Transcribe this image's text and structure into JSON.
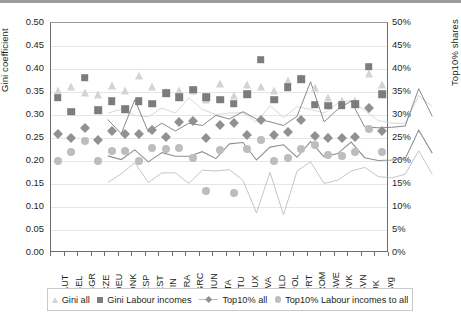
{
  "chart_data": {
    "type": "line",
    "title": "",
    "xlabel": "",
    "ylabel": "Gini coefficient",
    "ylabel_right": "Top10% shares",
    "ylim": [
      0.0,
      0.5
    ],
    "ylim_right": [
      0,
      50
    ],
    "grid": true,
    "legend_position": "bottom",
    "categories": [
      "AUT",
      "BEL",
      "BGR",
      "CZE",
      "DEU",
      "DNK",
      "ESP",
      "EST",
      "FIN",
      "FRA",
      "GRC",
      "HUN",
      "ITA",
      "LTU",
      "LUX",
      "LVA",
      "NLD",
      "POL",
      "PRT",
      "ROM",
      "SWE",
      "SVK",
      "SVN",
      "UK",
      "Avg"
    ],
    "yticks_left": [
      "0.00",
      "0.05",
      "0.10",
      "0.15",
      "0.20",
      "0.25",
      "0.30",
      "0.35",
      "0.40",
      "0.45",
      "0.50"
    ],
    "yticks_right": [
      "0%",
      "5%",
      "10%",
      "15%",
      "20%",
      "25%",
      "30%",
      "35%",
      "40%",
      "45%",
      "50%"
    ],
    "series": [
      {
        "name": "Gini all",
        "marker": "triangle",
        "color": "#d4d4d4",
        "axis": "left",
        "values": [
          0.352,
          0.36,
          0.347,
          0.344,
          0.363,
          0.352,
          0.385,
          0.36,
          0.349,
          0.352,
          0.353,
          0.332,
          0.368,
          0.342,
          0.366,
          0.36,
          0.352,
          0.373,
          0.38,
          0.358,
          0.336,
          0.33,
          0.33,
          0.39,
          0.366
        ]
      },
      {
        "name": "Gini Labour incomes",
        "marker": "square",
        "color": "#7c7c7c",
        "axis": "left",
        "values": [
          0.338,
          0.307,
          0.381,
          0.311,
          0.33,
          0.313,
          0.33,
          0.325,
          0.347,
          0.339,
          0.355,
          0.339,
          0.333,
          0.325,
          0.345,
          0.42,
          0.333,
          0.36,
          0.378,
          0.322,
          0.32,
          0.321,
          0.324,
          0.405,
          0.345
        ]
      },
      {
        "name": "Top10% all",
        "marker": "diamond",
        "color": "#919191",
        "axis": "right",
        "values": [
          0.259,
          0.251,
          0.272,
          0.246,
          0.266,
          0.258,
          0.258,
          0.268,
          0.253,
          0.285,
          0.288,
          0.25,
          0.278,
          0.283,
          0.256,
          0.29,
          0.257,
          0.264,
          0.289,
          0.255,
          0.249,
          0.25,
          0.253,
          0.315,
          0.265
        ]
      },
      {
        "name": "Top10% Labour incomes to all",
        "marker": "circle",
        "color": "#bdbdbd",
        "axis": "right",
        "values": [
          0.201,
          0.22,
          0.244,
          0.201,
          0.222,
          0.222,
          0.199,
          0.228,
          0.226,
          0.229,
          0.206,
          0.135,
          0.223,
          0.131,
          0.226,
          0.246,
          0.199,
          0.206,
          0.226,
          0.234,
          0.214,
          0.211,
          0.219,
          0.27,
          0.219
        ]
      }
    ]
  },
  "legend": {
    "items": [
      {
        "label": "Gini all"
      },
      {
        "label": "Gini Labour incomes"
      },
      {
        "label": "Top10% all"
      },
      {
        "label": "Top10% Labour incomes to all"
      }
    ]
  },
  "colors": {
    "gini_all": "#d4d4d4",
    "gini_labour": "#7c7c7c",
    "top10_all": "#919191",
    "top10_labour": "#bdbdbd",
    "axis": "#6d6d6d",
    "grid": "#e6e6e6",
    "text": "#231f20"
  }
}
